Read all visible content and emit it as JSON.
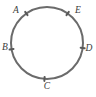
{
  "figure": {
    "kind": "geometry-diagram",
    "width": 96,
    "height": 97,
    "background_color": "#ffffff",
    "circle": {
      "center_x": 47,
      "center_y": 43,
      "radius": 36,
      "stroke_color": "#6b6b6b",
      "stroke_width": 2,
      "fill": "none"
    },
    "tick_mark": {
      "color": "#595959",
      "length": 4,
      "width": 2
    },
    "label_style": {
      "color": "#3a3a3a",
      "font_size": 9.5,
      "italic": true
    },
    "points": [
      {
        "id": "A",
        "label": "A",
        "angle_deg": 125,
        "px": 26.4,
        "py": 13.5,
        "label_x": 16,
        "label_y": 11,
        "label_anchor": "middle"
      },
      {
        "id": "E",
        "label": "E",
        "angle_deg": 55,
        "px": 67.6,
        "py": 13.5,
        "label_x": 78,
        "label_y": 11,
        "label_anchor": "middle"
      },
      {
        "id": "D",
        "label": "D",
        "angle_deg": 352,
        "px": 82.6,
        "py": 48.0,
        "label_x": 89,
        "label_y": 49,
        "label_anchor": "middle"
      },
      {
        "id": "C",
        "label": "C",
        "angle_deg": 266,
        "px": 44.5,
        "py": 78.9,
        "label_x": 47,
        "label_y": 87,
        "label_anchor": "middle"
      },
      {
        "id": "B",
        "label": "B",
        "angle_deg": 190,
        "px": 11.5,
        "py": 36.7,
        "label_x": 5,
        "label_y": 48,
        "label_anchor": "middle"
      }
    ]
  }
}
